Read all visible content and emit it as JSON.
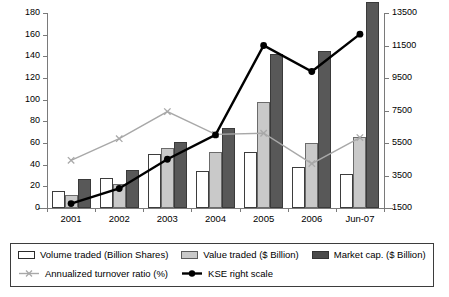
{
  "chart_data": {
    "type": "bar",
    "title": "",
    "subtitle": "",
    "xlabel": "",
    "ylabel": "",
    "categories": [
      "2001",
      "2002",
      "2003",
      "2004",
      "2005",
      "2006",
      "Jun-07"
    ],
    "ylim": [
      0,
      180
    ],
    "yticks": [
      0,
      20,
      40,
      60,
      80,
      100,
      120,
      140,
      160,
      180
    ],
    "y2lim": [
      1500,
      13500
    ],
    "y2ticks": [
      1500,
      3500,
      5500,
      7500,
      9500,
      11500,
      13500
    ],
    "grid": false,
    "legend_position": "bottom",
    "series": [
      {
        "name": "Volume traded (Billion Shares)",
        "type": "bar",
        "axis": "left",
        "color": "#ffffff",
        "values": [
          16,
          28,
          50,
          34,
          52,
          38,
          31
        ]
      },
      {
        "name": "Value traded ($ Billion)",
        "type": "bar",
        "axis": "left",
        "color": "#c9c9c9",
        "values": [
          12,
          22,
          55,
          52,
          98,
          60,
          66
        ]
      },
      {
        "name": "Market cap. ($ Billion)",
        "type": "bar",
        "axis": "left",
        "color": "#585858",
        "values": [
          27,
          35,
          61,
          74,
          142,
          145,
          190
        ]
      },
      {
        "name": "Annualized turnover ratio (%)",
        "type": "line",
        "axis": "left",
        "color": "#a8a8a8",
        "marker": "x",
        "values": [
          44,
          64,
          89,
          68,
          69,
          41,
          65
        ]
      },
      {
        "name": "KSE right scale",
        "type": "line",
        "axis": "right",
        "color": "#000000",
        "marker": "circle",
        "values": [
          1770,
          2700,
          4500,
          6000,
          11500,
          9900,
          12200
        ]
      }
    ]
  },
  "legend": {
    "items": [
      {
        "label": "Volume traded (Billion Shares)",
        "kind": "swatch",
        "style": "s0"
      },
      {
        "label": "Value traded ($ Billion)",
        "kind": "swatch",
        "style": "s1"
      },
      {
        "label": "Market cap. ($ Billion)",
        "kind": "swatch",
        "style": "s2"
      },
      {
        "label": "Annualized turnover ratio (%)",
        "kind": "line-x",
        "style": "gray"
      },
      {
        "label": "KSE right scale",
        "kind": "line-dot",
        "style": "black"
      }
    ]
  }
}
